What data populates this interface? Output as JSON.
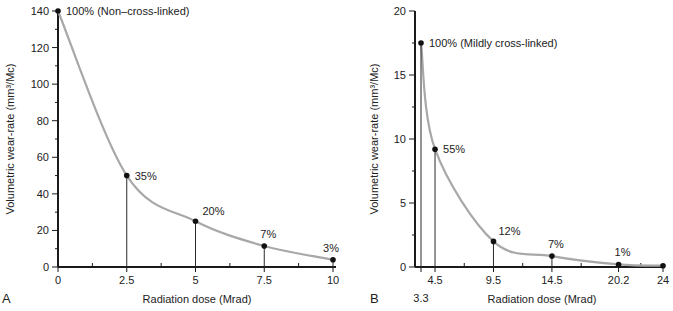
{
  "chart_data": [
    {
      "type": "line",
      "panel_label": "A",
      "xlabel": "Radiation dose (Mrad)",
      "ylabel": "Volumetric wear-rate (mm³/Mc)",
      "xlim": [
        0,
        10
      ],
      "ylim": [
        0,
        140
      ],
      "x_ticks": [
        0,
        2.5,
        5,
        7.5,
        10
      ],
      "x_tick_labels": [
        "0",
        "2.5",
        "5",
        "7.5",
        "10"
      ],
      "x_minor_step": 1.25,
      "y_ticks": [
        0,
        20,
        40,
        60,
        80,
        100,
        120,
        140
      ],
      "y_tick_labels": [
        "0",
        "20",
        "40",
        "60",
        "80",
        "100",
        "120",
        "140"
      ],
      "y_minor_step": 10,
      "grid": false,
      "points": [
        {
          "x": 0,
          "y": 140,
          "label": "100% (Non–cross-linked)"
        },
        {
          "x": 2.5,
          "y": 50,
          "label": "35%"
        },
        {
          "x": 5,
          "y": 25,
          "label": "20%"
        },
        {
          "x": 7.5,
          "y": 11.5,
          "label": "7%"
        },
        {
          "x": 10,
          "y": 4,
          "label": "3%"
        }
      ]
    },
    {
      "type": "line",
      "panel_label": "B",
      "xlabel": "Radiation dose (Mrad)",
      "ylabel": "Volumetric wear-rate (mm³/Mc)",
      "xlim": [
        2.8,
        24
      ],
      "ylim": [
        0,
        20
      ],
      "x_ticks": [
        3.3,
        4.5,
        9.5,
        14.5,
        20.2,
        24
      ],
      "x_tick_labels": [
        "3.3",
        "4.5",
        "9.5",
        "14.5",
        "20.2",
        "24"
      ],
      "x_minor_ticks": [
        7,
        12,
        17,
        22.1
      ],
      "y_ticks": [
        0,
        5,
        10,
        15,
        20
      ],
      "y_tick_labels": [
        "0",
        "5",
        "10",
        "15",
        "20"
      ],
      "y_minor_step": 2.5,
      "grid": false,
      "points": [
        {
          "x": 3.3,
          "y": 17.5,
          "label": "100% (Mildly cross-linked)"
        },
        {
          "x": 4.5,
          "y": 9.2,
          "label": "55%"
        },
        {
          "x": 9.5,
          "y": 2.0,
          "label": "12%"
        },
        {
          "x": 14.5,
          "y": 0.85,
          "label": "7%"
        },
        {
          "x": 20.2,
          "y": 0.2,
          "label": "1%"
        },
        {
          "x": 24,
          "y": 0.1,
          "label": ""
        }
      ]
    }
  ]
}
